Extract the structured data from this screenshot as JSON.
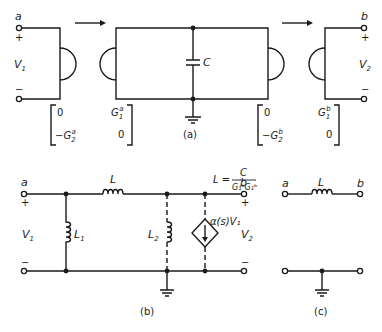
{
  "figure": {
    "part_a": {
      "caption": "(a)",
      "left_port": {
        "terminal": "a",
        "plus": "+",
        "minus": "−",
        "voltage": "V",
        "voltage_sub": "1"
      },
      "right_port": {
        "terminal": "b",
        "plus": "+",
        "minus": "−",
        "voltage": "V",
        "voltage_sub": "2"
      },
      "capacitor_label": "C",
      "matrices": [
        {
          "top": "0",
          "bottom": "−G",
          "bottom_sub": "2",
          "bottom_sup": "a"
        },
        {
          "top": "G",
          "top_sub": "1",
          "top_sup": "a",
          "bottom": "0"
        },
        {
          "top": "0",
          "bottom": "−G",
          "bottom_sub": "2",
          "bottom_sup": "b"
        },
        {
          "top": "G",
          "top_sub": "1",
          "top_sup": "b",
          "bottom": "0"
        }
      ]
    },
    "part_b": {
      "caption": "(b)",
      "equation": {
        "lhs": "L =",
        "numerator": "C",
        "denominator": "G₁ᵃG₁ᵇ"
      },
      "left_port": {
        "terminal": "a",
        "plus": "+",
        "minus": "−",
        "voltage": "V",
        "voltage_sub": "1"
      },
      "right_port": {
        "terminal": "b",
        "plus": "+",
        "minus": "−",
        "voltage": "V",
        "voltage_sub": "2"
      },
      "series_inductor": "L",
      "shunt_inductor_1": {
        "label": "L",
        "sub": "1"
      },
      "shunt_inductor_2": {
        "label": "L",
        "sub": "2"
      },
      "dependent_source": "α(s)V₁"
    },
    "part_c": {
      "caption": "(c)",
      "terminal_left": "a",
      "terminal_right": "b",
      "inductor_label": "L"
    }
  }
}
